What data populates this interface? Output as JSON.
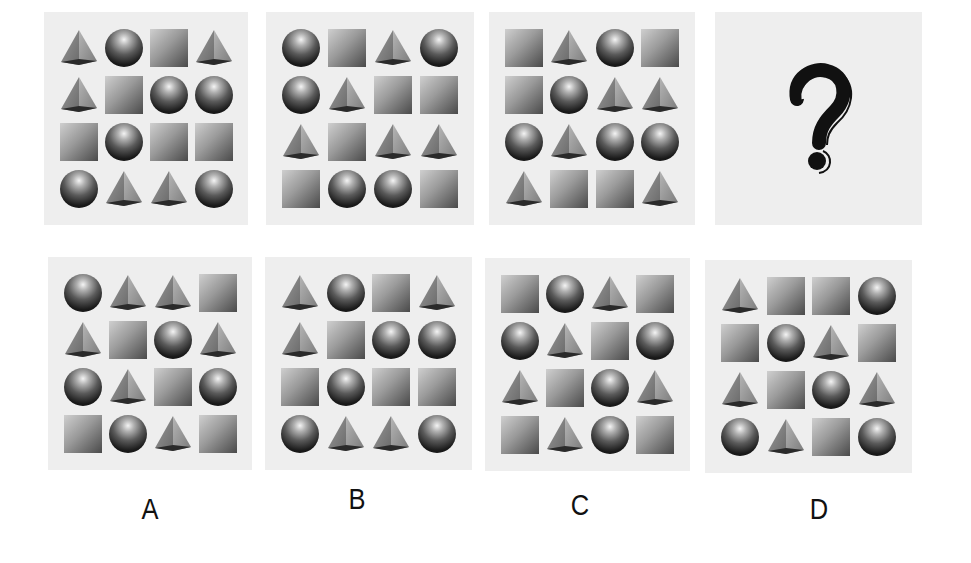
{
  "question": {
    "panels": [
      {
        "id": "1",
        "grid": [
          [
            "pyramid",
            "sphere",
            "cube",
            "pyramid"
          ],
          [
            "pyramid",
            "cube",
            "sphere",
            "sphere"
          ],
          [
            "cube",
            "sphere",
            "cube",
            "cube"
          ],
          [
            "sphere",
            "pyramid",
            "pyramid",
            "sphere"
          ]
        ]
      },
      {
        "id": "2",
        "grid": [
          [
            "sphere",
            "cube",
            "pyramid",
            "sphere"
          ],
          [
            "sphere",
            "pyramid",
            "cube",
            "cube"
          ],
          [
            "pyramid",
            "cube",
            "pyramid",
            "pyramid"
          ],
          [
            "cube",
            "sphere",
            "sphere",
            "cube"
          ]
        ]
      },
      {
        "id": "3",
        "grid": [
          [
            "cube",
            "pyramid",
            "sphere",
            "cube"
          ],
          [
            "cube",
            "sphere",
            "pyramid",
            "pyramid"
          ],
          [
            "sphere",
            "pyramid",
            "sphere",
            "sphere"
          ],
          [
            "pyramid",
            "cube",
            "cube",
            "pyramid"
          ]
        ]
      },
      {
        "id": "4",
        "placeholder": "?",
        "icon": "question-mark-icon"
      }
    ]
  },
  "options": [
    {
      "label": "A",
      "grid": [
        [
          "sphere",
          "pyramid",
          "pyramid",
          "cube"
        ],
        [
          "pyramid",
          "cube",
          "sphere",
          "pyramid"
        ],
        [
          "sphere",
          "pyramid",
          "cube",
          "sphere"
        ],
        [
          "cube",
          "sphere",
          "pyramid",
          "cube"
        ]
      ]
    },
    {
      "label": "B",
      "grid": [
        [
          "pyramid",
          "sphere",
          "cube",
          "pyramid"
        ],
        [
          "pyramid",
          "cube",
          "sphere",
          "sphere"
        ],
        [
          "cube",
          "sphere",
          "cube",
          "cube"
        ],
        [
          "sphere",
          "pyramid",
          "pyramid",
          "sphere"
        ]
      ]
    },
    {
      "label": "C",
      "grid": [
        [
          "cube",
          "sphere",
          "pyramid",
          "cube"
        ],
        [
          "sphere",
          "pyramid",
          "cube",
          "sphere"
        ],
        [
          "pyramid",
          "cube",
          "sphere",
          "pyramid"
        ],
        [
          "cube",
          "pyramid",
          "sphere",
          "cube"
        ]
      ]
    },
    {
      "label": "D",
      "grid": [
        [
          "pyramid",
          "cube",
          "cube",
          "sphere"
        ],
        [
          "cube",
          "sphere",
          "pyramid",
          "cube"
        ],
        [
          "pyramid",
          "cube",
          "sphere",
          "pyramid"
        ],
        [
          "sphere",
          "pyramid",
          "cube",
          "sphere"
        ]
      ]
    }
  ],
  "colors": {
    "panel_bg": "#eeeeee",
    "page_bg": "#ffffff",
    "text": "#111111"
  }
}
